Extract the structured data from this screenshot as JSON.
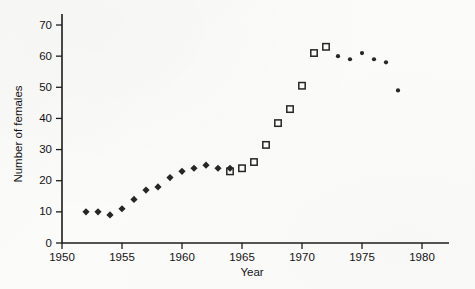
{
  "chart_data": {
    "type": "scatter",
    "title": "",
    "xlabel": "Year",
    "ylabel": "Number of females",
    "xlim": [
      1950,
      1980
    ],
    "ylim": [
      0,
      70
    ],
    "xticks": [
      1950,
      1955,
      1960,
      1965,
      1970,
      1975,
      1980
    ],
    "yticks": [
      0,
      10,
      20,
      30,
      40,
      50,
      60,
      70
    ],
    "xtick_labels": [
      "1950",
      "1955",
      "1960",
      "1965",
      "1970",
      "1975",
      "1980"
    ],
    "ytick_labels": [
      "0",
      "10",
      "20",
      "30",
      "40",
      "50",
      "60",
      "70"
    ],
    "grid": false,
    "legend": "none",
    "series": [
      {
        "name": "filled-diamond-series",
        "marker": "diamond",
        "marker_style": "filled",
        "color": "#262626",
        "points": [
          {
            "x": 1952,
            "y": 10
          },
          {
            "x": 1953,
            "y": 10
          },
          {
            "x": 1954,
            "y": 9
          },
          {
            "x": 1955,
            "y": 11
          },
          {
            "x": 1956,
            "y": 14
          },
          {
            "x": 1957,
            "y": 17
          },
          {
            "x": 1958,
            "y": 18
          },
          {
            "x": 1959,
            "y": 21
          },
          {
            "x": 1960,
            "y": 23
          },
          {
            "x": 1961,
            "y": 24
          },
          {
            "x": 1962,
            "y": 25
          },
          {
            "x": 1963,
            "y": 24
          },
          {
            "x": 1964,
            "y": 24
          }
        ]
      },
      {
        "name": "open-square-series",
        "marker": "square",
        "marker_style": "open",
        "color": "#262626",
        "points": [
          {
            "x": 1964,
            "y": 23
          },
          {
            "x": 1965,
            "y": 24
          },
          {
            "x": 1966,
            "y": 26
          },
          {
            "x": 1967,
            "y": 31.5
          },
          {
            "x": 1968,
            "y": 38.5
          },
          {
            "x": 1969,
            "y": 43
          },
          {
            "x": 1970,
            "y": 50.5
          },
          {
            "x": 1971,
            "y": 61
          },
          {
            "x": 1972,
            "y": 63
          }
        ]
      },
      {
        "name": "small-dot-series",
        "marker": "dot",
        "marker_style": "filled",
        "color": "#262626",
        "points": [
          {
            "x": 1973,
            "y": 60
          },
          {
            "x": 1974,
            "y": 59
          },
          {
            "x": 1975,
            "y": 61
          },
          {
            "x": 1976,
            "y": 59
          },
          {
            "x": 1977,
            "y": 58
          },
          {
            "x": 1978,
            "y": 49
          }
        ]
      }
    ]
  }
}
